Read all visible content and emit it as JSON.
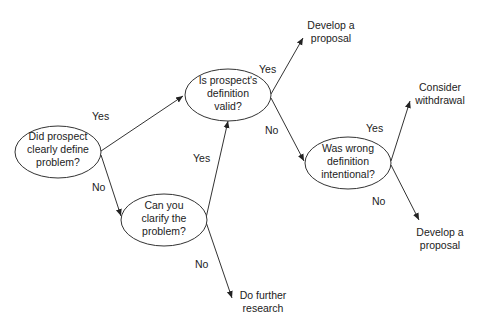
{
  "diagram": {
    "type": "decision-tree",
    "nodes": {
      "n1": {
        "lines": [
          "Did prospect",
          "clearly define",
          "problem?"
        ]
      },
      "n2": {
        "lines": [
          "Is prospect's",
          "definition",
          "valid?"
        ]
      },
      "n3": {
        "lines": [
          "Can you",
          "clarify the",
          "problem?"
        ]
      },
      "n4": {
        "lines": [
          "Was wrong",
          "definition",
          "intentional?"
        ]
      }
    },
    "outcomes": {
      "o1": {
        "lines": [
          "Develop a",
          "proposal"
        ]
      },
      "o2": {
        "lines": [
          "Consider",
          "withdrawal"
        ]
      },
      "o3": {
        "lines": [
          "Develop a",
          "proposal"
        ]
      },
      "o4": {
        "lines": [
          "Do further",
          "research"
        ]
      }
    },
    "edges": {
      "e1": {
        "label": "Yes"
      },
      "e2": {
        "label": "No"
      },
      "e3": {
        "label": "Yes"
      },
      "e4": {
        "label": "No"
      },
      "e5": {
        "label": "Yes"
      },
      "e6": {
        "label": "No"
      },
      "e7": {
        "label": "Yes"
      },
      "e8": {
        "label": "No"
      }
    }
  }
}
